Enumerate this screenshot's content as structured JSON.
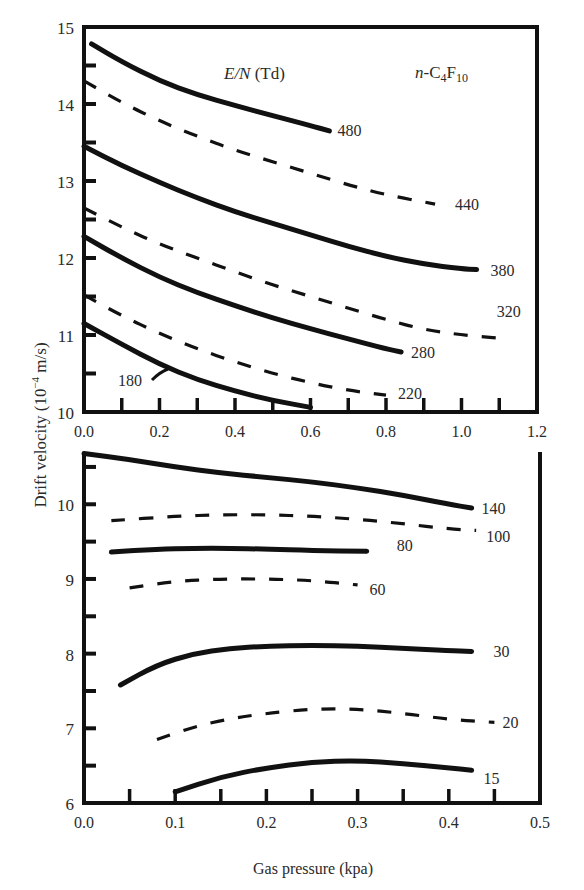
{
  "chart_data": [
    {
      "type": "line",
      "panel": "top",
      "title": "",
      "annotation_header": "E/N (Td)",
      "gas_label": "n-C4F10",
      "xlabel": "",
      "ylabel": "Drift velocity (10^-4 m/s)",
      "xlim": [
        0.0,
        1.2
      ],
      "ylim": [
        10,
        15
      ],
      "x_ticks": [
        "0.0",
        "0.2",
        "0.4",
        "0.6",
        "0.8",
        "1.0",
        "1.2"
      ],
      "y_ticks": [
        "10",
        "11",
        "12",
        "13",
        "14",
        "15"
      ],
      "grid": false,
      "series": [
        {
          "name": "480",
          "style": "solid",
          "x": [
            0.02,
            0.1,
            0.2,
            0.3,
            0.4,
            0.5,
            0.6,
            0.65
          ],
          "y": [
            14.78,
            14.55,
            14.3,
            14.12,
            13.98,
            13.85,
            13.72,
            13.65
          ]
        },
        {
          "name": "440",
          "style": "dashed",
          "x": [
            0.0,
            0.1,
            0.2,
            0.3,
            0.4,
            0.5,
            0.6,
            0.7,
            0.8,
            0.93
          ],
          "y": [
            14.3,
            14.02,
            13.78,
            13.58,
            13.4,
            13.25,
            13.1,
            12.95,
            12.82,
            12.7
          ]
        },
        {
          "name": "380",
          "style": "solid",
          "x": [
            0.0,
            0.1,
            0.2,
            0.3,
            0.4,
            0.5,
            0.6,
            0.7,
            0.8,
            0.9,
            1.0,
            1.04
          ],
          "y": [
            13.45,
            13.2,
            12.98,
            12.78,
            12.6,
            12.45,
            12.3,
            12.15,
            12.02,
            11.92,
            11.86,
            11.85
          ]
        },
        {
          "name": "320",
          "style": "dashed",
          "x": [
            0.0,
            0.1,
            0.2,
            0.3,
            0.4,
            0.5,
            0.6,
            0.7,
            0.8,
            0.9,
            1.0,
            1.12
          ],
          "y": [
            12.65,
            12.4,
            12.18,
            12.0,
            11.82,
            11.65,
            11.5,
            11.35,
            11.2,
            11.07,
            11.0,
            10.95
          ]
        },
        {
          "name": "280",
          "style": "solid",
          "x": [
            0.0,
            0.1,
            0.2,
            0.3,
            0.4,
            0.5,
            0.6,
            0.7,
            0.8,
            0.84
          ],
          "y": [
            12.28,
            12.0,
            11.75,
            11.55,
            11.38,
            11.22,
            11.08,
            10.95,
            10.82,
            10.78
          ]
        },
        {
          "name": "220",
          "style": "dashed",
          "x": [
            0.0,
            0.1,
            0.2,
            0.3,
            0.4,
            0.5,
            0.6,
            0.7,
            0.8
          ],
          "y": [
            11.52,
            11.25,
            11.02,
            10.82,
            10.65,
            10.5,
            10.38,
            10.28,
            10.22
          ]
        },
        {
          "name": "180",
          "style": "solid",
          "x": [
            0.0,
            0.1,
            0.2,
            0.3,
            0.4,
            0.5,
            0.6
          ],
          "y": [
            11.15,
            10.88,
            10.62,
            10.42,
            10.27,
            10.15,
            10.06
          ]
        }
      ]
    },
    {
      "type": "line",
      "panel": "bottom",
      "title": "",
      "xlabel": "Gas pressure (kpa)",
      "ylabel": "Drift velocity (10^-4 m/s)",
      "xlim": [
        0.0,
        0.5
      ],
      "ylim": [
        6,
        10.7
      ],
      "x_ticks": [
        "0.0",
        "0.1",
        "0.2",
        "0.3",
        "0.4",
        "0.5"
      ],
      "y_ticks": [
        "6",
        "7",
        "8",
        "9",
        "10"
      ],
      "grid": false,
      "series": [
        {
          "name": "140",
          "style": "solid",
          "x": [
            0.0,
            0.05,
            0.1,
            0.15,
            0.2,
            0.25,
            0.3,
            0.35,
            0.4,
            0.425
          ],
          "y": [
            10.68,
            10.6,
            10.5,
            10.42,
            10.36,
            10.3,
            10.22,
            10.12,
            10.0,
            9.95
          ]
        },
        {
          "name": "100",
          "style": "dashed",
          "x": [
            0.03,
            0.1,
            0.15,
            0.2,
            0.25,
            0.3,
            0.35,
            0.4,
            0.43
          ],
          "y": [
            9.78,
            9.84,
            9.86,
            9.86,
            9.84,
            9.8,
            9.74,
            9.67,
            9.65
          ]
        },
        {
          "name": "80",
          "style": "solid",
          "x": [
            0.03,
            0.08,
            0.12,
            0.16,
            0.2,
            0.25,
            0.31
          ],
          "y": [
            9.36,
            9.4,
            9.41,
            9.41,
            9.4,
            9.38,
            9.37
          ]
        },
        {
          "name": "60",
          "style": "dashed",
          "x": [
            0.05,
            0.1,
            0.15,
            0.2,
            0.25,
            0.3
          ],
          "y": [
            8.88,
            8.97,
            9.0,
            9.0,
            8.98,
            8.92
          ]
        },
        {
          "name": "30",
          "style": "solid",
          "x": [
            0.04,
            0.08,
            0.12,
            0.16,
            0.2,
            0.25,
            0.3,
            0.35,
            0.4,
            0.425
          ],
          "y": [
            7.58,
            7.85,
            8.0,
            8.07,
            8.1,
            8.11,
            8.1,
            8.07,
            8.04,
            8.03
          ]
        },
        {
          "name": "20",
          "style": "dashed",
          "x": [
            0.08,
            0.12,
            0.16,
            0.2,
            0.25,
            0.3,
            0.35,
            0.4,
            0.45
          ],
          "y": [
            6.85,
            7.02,
            7.13,
            7.2,
            7.26,
            7.26,
            7.2,
            7.12,
            7.08
          ]
        },
        {
          "name": "15",
          "style": "solid",
          "x": [
            0.1,
            0.15,
            0.2,
            0.25,
            0.3,
            0.35,
            0.4,
            0.425
          ],
          "y": [
            6.15,
            6.35,
            6.47,
            6.55,
            6.57,
            6.53,
            6.47,
            6.44
          ]
        }
      ]
    }
  ],
  "figure": {
    "ylabel_text": "Drift velocity (10",
    "ylabel_exp": "−4",
    "ylabel_unit": " m/s)",
    "xlabel_text": "Gas pressure (kpa)",
    "header_en": "E/N",
    "header_td": " (Td)",
    "gas_prefix": "n",
    "gas_c": "-C",
    "gas_sub1": "4",
    "gas_f": "F",
    "gas_sub2": "10"
  }
}
